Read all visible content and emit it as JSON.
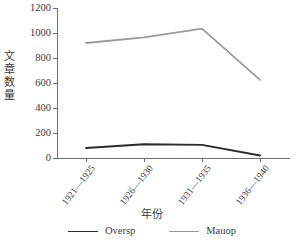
{
  "chart_data": {
    "type": "line",
    "title": "",
    "xlabel": "年份",
    "ylabel": "文章数量",
    "categories": [
      "1921—1925",
      "1926—1930",
      "1931—1935",
      "1936—1940"
    ],
    "series": [
      {
        "name": "Oversp",
        "values": [
          80,
          110,
          105,
          20
        ],
        "color": "#2b2b2b"
      },
      {
        "name": "Mauop",
        "values": [
          920,
          965,
          1035,
          625
        ],
        "color": "#9a9a9a"
      }
    ],
    "ylim": [
      0,
      1200
    ],
    "yticks": [
      0,
      200,
      400,
      600,
      800,
      1000,
      1200
    ],
    "ytick_labels": [
      "0",
      "200",
      "400",
      "600",
      "800",
      "1000",
      "1200"
    ],
    "grid": false,
    "legend_position": "bottom"
  },
  "axes": {
    "y_title": "文章数量",
    "x_title": "年份"
  },
  "legend": {
    "items": [
      {
        "label": "Oversp",
        "color": "#2b2b2b"
      },
      {
        "label": "Mauop",
        "color": "#9a9a9a"
      }
    ]
  }
}
